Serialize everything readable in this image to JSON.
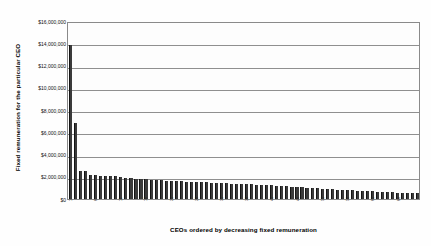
{
  "chart_data": {
    "type": "bar",
    "title": "",
    "xlabel": "CEOs ordered by decreasing fixed remuneration",
    "ylabel": "Fixed remuneration for the particular CEO",
    "ylim": [
      0,
      16000000
    ],
    "ytick_labels": [
      "$16,000,000",
      "$14,000,000",
      "$12,000,000",
      "$10,000,000",
      "$8,000,000",
      "$6,000,000",
      "$4,000,000",
      "$2,000,000",
      "$0"
    ],
    "ytick_values": [
      16000000,
      14000000,
      12000000,
      10000000,
      8000000,
      6000000,
      4000000,
      2000000,
      0
    ],
    "grid": true,
    "legend": false,
    "bar_color": "#3a3a3a",
    "categories": [
      "1",
      "2",
      "3",
      "4",
      "5",
      "6",
      "7",
      "8",
      "9",
      "10",
      "11",
      "12",
      "13",
      "14",
      "15",
      "16",
      "17",
      "18",
      "19",
      "20",
      "21",
      "22",
      "23",
      "24",
      "25",
      "26",
      "27",
      "28",
      "29",
      "30",
      "31",
      "32",
      "33",
      "34",
      "35",
      "36",
      "37",
      "38",
      "39",
      "40",
      "41",
      "42",
      "43",
      "44",
      "45",
      "46",
      "47",
      "48",
      "49",
      "50",
      "51",
      "52",
      "53",
      "54",
      "55",
      "56",
      "57",
      "58",
      "59",
      "60",
      "61",
      "62",
      "63",
      "64",
      "65",
      "66",
      "67",
      "68",
      "69",
      "70"
    ],
    "xtick_labels_visible": [
      "1",
      "10",
      "20",
      "30",
      "40",
      "50",
      "60",
      "70"
    ],
    "values": [
      13800000,
      6800000,
      2550000,
      2480000,
      2180000,
      2130000,
      2100000,
      2080000,
      2060000,
      2030000,
      1950000,
      1900000,
      1870000,
      1840000,
      1800000,
      1770000,
      1740000,
      1710000,
      1680000,
      1650000,
      1630000,
      1610000,
      1590000,
      1570000,
      1550000,
      1530000,
      1510000,
      1490000,
      1470000,
      1450000,
      1430000,
      1410000,
      1390000,
      1370000,
      1350000,
      1330000,
      1310000,
      1290000,
      1270000,
      1250000,
      1220000,
      1190000,
      1160000,
      1130000,
      1100000,
      1070000,
      1040000,
      1010000,
      980000,
      950000,
      920000,
      895000,
      870000,
      845000,
      820000,
      795000,
      770000,
      745000,
      720000,
      700000,
      680000,
      660000,
      640000,
      620000,
      600000,
      580000,
      560000,
      540000,
      520000,
      500000
    ]
  }
}
